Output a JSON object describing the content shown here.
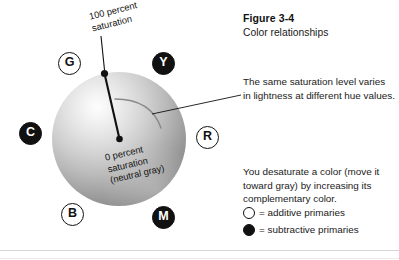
{
  "figure": {
    "title": "Figure 3-4",
    "subtitle": "Color relationships"
  },
  "diagram": {
    "outer_saturation_label": "100 percent\nsaturation",
    "outer_saturation_label_line1": "100 percent",
    "outer_saturation_label_line2": "saturation",
    "center_label_line1": "0 percent",
    "center_label_line2": "saturation",
    "center_label_line3": "(neutral gray)",
    "hue_markers": [
      {
        "letter": "G",
        "name": "green",
        "type": "additive",
        "position": "upper-left"
      },
      {
        "letter": "Y",
        "name": "yellow",
        "type": "subtractive",
        "position": "upper-right"
      },
      {
        "letter": "C",
        "name": "cyan",
        "type": "subtractive",
        "position": "left"
      },
      {
        "letter": "R",
        "name": "red",
        "type": "additive",
        "position": "right"
      },
      {
        "letter": "B",
        "name": "blue",
        "type": "additive",
        "position": "lower-left"
      },
      {
        "letter": "M",
        "name": "magenta",
        "type": "subtractive",
        "position": "lower-right"
      }
    ]
  },
  "notes": {
    "hue_lightness": "The same saturation level varies in lightness at different hue values.",
    "desaturate": "You desaturate a color (move it toward gray) by increasing its complementary color."
  },
  "legend": {
    "items": [
      {
        "symbol": "open-circle",
        "text": "= additive primaries"
      },
      {
        "symbol": "filled-circle",
        "text": "= subtractive primaries"
      }
    ]
  },
  "colors": {
    "ink": "#111111",
    "rule": "#d7d7d7",
    "arc": "#8a8a8a",
    "sphere_light": "#fdfdfd",
    "sphere_dark": "#7a7a7a"
  }
}
